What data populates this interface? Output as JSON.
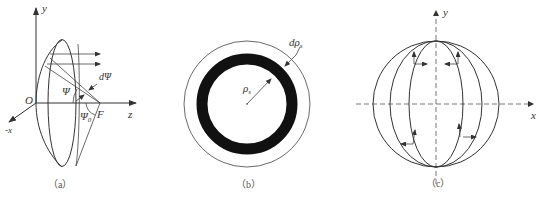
{
  "figure": {
    "panels": [
      {
        "id": "a",
        "caption": "（a）",
        "labels": {
          "y_axis": "y",
          "z_axis": "z",
          "neg_x_axis": "-x",
          "origin": "O",
          "focus": "F",
          "angle": "Ψ",
          "angle_increment": "dΨ",
          "half_angle": "Ψ",
          "half_angle_sub": "0"
        }
      },
      {
        "id": "b",
        "caption": "（b）",
        "labels": {
          "radius": "ρ",
          "radius_sub": "s",
          "radius_increment": "dρ",
          "radius_increment_sub": "s"
        }
      },
      {
        "id": "c",
        "caption": "（c）",
        "labels": {
          "y_axis": "y",
          "x_axis": "x"
        }
      }
    ],
    "colors": {
      "line": "#333333",
      "ring_fill": "#111111",
      "background": "#ffffff"
    }
  }
}
